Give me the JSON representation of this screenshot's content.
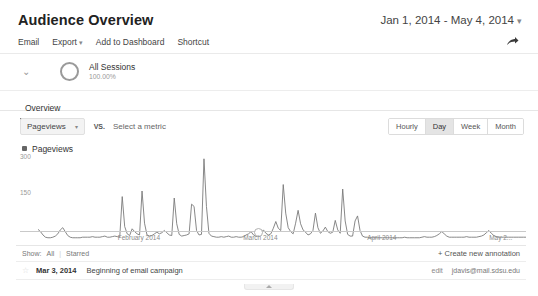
{
  "header": {
    "title": "Audience Overview",
    "date_range": "Jan 1, 2014 - May 4, 2014",
    "date_caret": "▾"
  },
  "toolbar": {
    "email": "Email",
    "export": "Export",
    "export_caret": "▾",
    "add_to_dashboard": "Add to Dashboard",
    "shortcut": "Shortcut",
    "share_icon": "share-icon"
  },
  "segment": {
    "chevron": "⌄",
    "name": "All Sessions",
    "percent": "100.00%"
  },
  "tabs": [
    {
      "label": "Overview",
      "active": true
    }
  ],
  "metric_selector": {
    "primary_metric": "Pageviews",
    "caret": "▾",
    "vs": "VS.",
    "secondary_placeholder": "Select a metric"
  },
  "granularity": {
    "options": [
      "Hourly",
      "Day",
      "Week",
      "Month"
    ],
    "selected": "Day"
  },
  "legend": {
    "label": "Pageviews",
    "color": "#666666"
  },
  "annotations_panel": {
    "show_label": "Show:",
    "show_all": "All",
    "separator": "|",
    "show_starred": "Starred",
    "create_new": "+ Create new annotation",
    "rows": [
      {
        "star": "☆",
        "date": "Mar 3, 2014",
        "text": "Beginning of email campaign",
        "edit": "edit",
        "owner": "jdavis@mail.sdsu.edu"
      }
    ]
  },
  "chart_data": {
    "type": "line",
    "title": "Pageviews",
    "xlabel": "",
    "ylabel": "Pageviews",
    "ylim": [
      0,
      300
    ],
    "yticks": [
      150,
      300
    ],
    "ytick_labels": [
      "150",
      "300"
    ],
    "grid": false,
    "legend_position": "top-left",
    "line_color": "#7a7a7a",
    "x_tick_labels": [
      "February 2014",
      "March 2014",
      "April 2014",
      "May 2..."
    ],
    "x_tick_positions_pct": [
      23.5,
      47.5,
      71.5,
      95.0
    ],
    "annotation_marker_pct": 47.0,
    "series": [
      {
        "name": "Pageviews",
        "values": [
          38,
          30,
          18,
          10,
          8,
          8,
          10,
          14,
          22,
          36,
          44,
          30,
          16,
          10,
          8,
          8,
          8,
          8,
          10,
          10,
          10,
          10,
          12,
          10,
          10,
          10,
          12,
          14,
          10,
          10,
          12,
          14,
          12,
          10,
          155,
          48,
          22,
          16,
          40,
          30,
          22,
          18,
          175,
          60,
          18,
          14,
          16,
          22,
          28,
          22,
          26,
          34,
          26,
          18,
          16,
          150,
          58,
          20,
          14,
          16,
          18,
          22,
          128,
          120,
          34,
          18,
          20,
          290,
          120,
          24,
          14,
          12,
          10,
          10,
          12,
          10,
          12,
          14,
          10,
          10,
          12,
          10,
          10,
          12,
          18,
          22,
          30,
          18,
          14,
          16,
          26,
          36,
          24,
          18,
          22,
          42,
          66,
          42,
          34,
          198,
          96,
          44,
          30,
          22,
          60,
          106,
          58,
          36,
          28,
          18,
          22,
          34,
          96,
          44,
          24,
          32,
          46,
          30,
          24,
          28,
          70,
          36,
          24,
          182,
          68,
          20,
          14,
          14,
          68,
          86,
          34,
          14,
          10,
          10,
          8,
          8,
          8,
          8,
          8,
          8,
          8,
          8,
          8,
          8,
          8,
          8,
          8,
          8,
          10,
          8,
          8,
          8,
          8,
          8,
          8,
          10,
          12,
          10,
          10,
          10,
          12,
          16,
          22,
          30,
          22,
          14,
          10,
          10,
          10,
          10,
          10,
          10,
          10,
          12,
          10,
          10,
          10,
          10,
          12,
          14,
          18,
          26,
          34,
          24,
          16,
          12,
          10,
          10,
          10,
          10,
          10,
          10,
          10,
          10,
          10,
          10,
          10,
          10
        ]
      }
    ]
  }
}
